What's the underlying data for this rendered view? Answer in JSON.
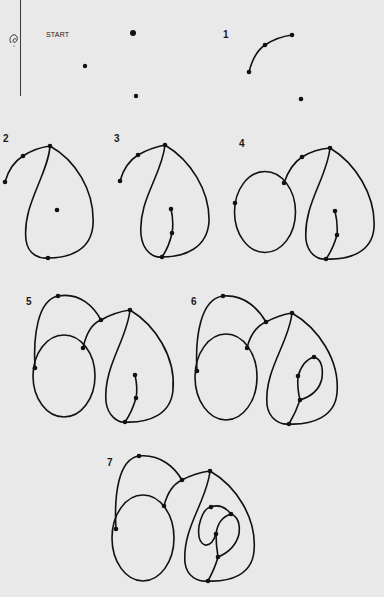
{
  "document": {
    "title": "START",
    "step_labels": [
      "1",
      "2",
      "3",
      "4",
      "5",
      "6",
      "7"
    ],
    "margin_mark": "binding-margin-line"
  },
  "colors": {
    "paper": "#e9e9e9",
    "ink": "#111111"
  },
  "steps": [
    {
      "label": "START",
      "dots": [
        [
          133,
          33
        ],
        [
          85,
          66
        ],
        [
          136,
          96
        ]
      ]
    },
    {
      "label": "1",
      "dots": [
        [
          249,
          72
        ],
        [
          265,
          45
        ],
        [
          292,
          35
        ],
        [
          301,
          99
        ]
      ]
    },
    {
      "label": "2",
      "dots": [
        [
          5,
          182
        ],
        [
          23,
          156
        ],
        [
          50,
          146
        ],
        [
          57,
          210
        ],
        [
          48,
          258
        ]
      ]
    },
    {
      "label": "3",
      "dots": [
        [
          120,
          181
        ],
        [
          138,
          155
        ],
        [
          165,
          145
        ],
        [
          171,
          209
        ],
        [
          172,
          233
        ],
        [
          162,
          257
        ]
      ]
    },
    {
      "label": "4",
      "dots": [
        [
          235,
          203
        ],
        [
          284,
          183
        ],
        [
          302,
          157
        ],
        [
          330,
          148
        ],
        [
          335,
          211
        ],
        [
          337,
          235
        ],
        [
          326,
          259
        ]
      ]
    },
    {
      "label": "5",
      "dots": [
        [
          58,
          296
        ],
        [
          101,
          320
        ],
        [
          130,
          310
        ],
        [
          83,
          348
        ],
        [
          35,
          368
        ],
        [
          135,
          375
        ],
        [
          136,
          398
        ],
        [
          125,
          422
        ]
      ]
    },
    {
      "label": "6",
      "dots": [
        [
          223,
          296
        ],
        [
          266,
          322
        ],
        [
          292,
          313
        ],
        [
          247,
          348
        ],
        [
          197,
          371
        ],
        [
          314,
          357
        ],
        [
          298,
          376
        ],
        [
          300,
          400
        ],
        [
          289,
          424
        ]
      ]
    },
    {
      "label": "7",
      "dots": [
        [
          139,
          456
        ],
        [
          182,
          480
        ],
        [
          210,
          471
        ],
        [
          164,
          506
        ],
        [
          116,
          529
        ],
        [
          211,
          507
        ],
        [
          231,
          514
        ],
        [
          216,
          534
        ],
        [
          218,
          557
        ],
        [
          208,
          581
        ]
      ]
    }
  ]
}
